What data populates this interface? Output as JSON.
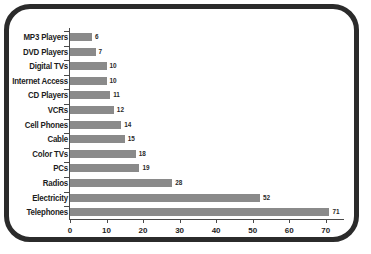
{
  "chart_data": {
    "type": "bar",
    "orientation": "horizontal",
    "title": "",
    "xlabel": "",
    "ylabel": "",
    "categories": [
      "MP3 Players",
      "DVD Players",
      "Digital TVs",
      "Internet Access",
      "CD Players",
      "VCRs",
      "Cell Phones",
      "Cable",
      "Color TVs",
      "PCs",
      "Radios",
      "Electricity",
      "Telephones"
    ],
    "values": [
      6,
      7,
      10,
      10,
      11,
      12,
      14,
      15,
      18,
      19,
      28,
      52,
      71
    ],
    "value_labels": [
      "6",
      "7",
      "10",
      "10",
      "11",
      "12",
      "14",
      "15",
      "18",
      "19",
      "28",
      "52",
      "71"
    ],
    "xlim": [
      0,
      75
    ],
    "xticks": [
      0,
      10,
      20,
      30,
      40,
      50,
      60,
      70
    ],
    "xtick_labels": [
      "0",
      "10",
      "20",
      "30",
      "40",
      "50",
      "60",
      "70"
    ],
    "grid": false,
    "legend": null,
    "colors": {
      "bar": "#8a8a8a",
      "axis": "#4a4a4a",
      "text": "#1d1d1d",
      "frame": "#2b2b2b",
      "background": "#ffffff"
    }
  }
}
